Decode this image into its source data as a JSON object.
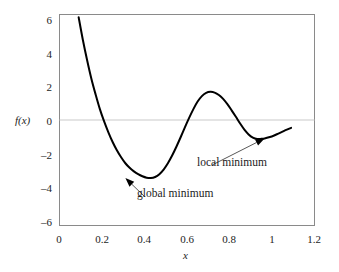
{
  "figure": {
    "background_color": "#ffffff",
    "frame_color": "#8a8a8a",
    "curve_color": "#000000",
    "zero_line_color": "#c9c9c9",
    "text_color": "#242424"
  },
  "chart_data": {
    "type": "line",
    "title": "",
    "subtitle": "",
    "xlabel": "x",
    "ylabel": "f(x)",
    "xlim": [
      0,
      1.2
    ],
    "ylim": [
      -6,
      6
    ],
    "grid": false,
    "zero_line": true,
    "legend": "none",
    "x_ticks": [
      0,
      0.2,
      0.4,
      0.6,
      0.8,
      1,
      1.2
    ],
    "x_tick_labels": [
      "0",
      "0.2",
      "0.4",
      "0.6",
      "0.8",
      "1",
      "1.2"
    ],
    "y_ticks": [
      6,
      4,
      2,
      0,
      -2,
      -4,
      -6
    ],
    "y_tick_labels": [
      "6",
      "4",
      "2",
      "0",
      "–2",
      "–4",
      "–6"
    ],
    "series": [
      {
        "name": "f(x)",
        "color": "#000000",
        "line_width": 2.0,
        "x": [
          0.09,
          0.11,
          0.13,
          0.15,
          0.17,
          0.19,
          0.21,
          0.23,
          0.25,
          0.27,
          0.29,
          0.31,
          0.33,
          0.35,
          0.37,
          0.39,
          0.41,
          0.43,
          0.45,
          0.47,
          0.49,
          0.51,
          0.53,
          0.55,
          0.57,
          0.59,
          0.61,
          0.63,
          0.65,
          0.67,
          0.69,
          0.71,
          0.73,
          0.75,
          0.77,
          0.79,
          0.81,
          0.83,
          0.85,
          0.87,
          0.89,
          0.91,
          0.93,
          0.95,
          0.965,
          0.99,
          1.01,
          1.03,
          1.05,
          1.07,
          1.09
        ],
        "y": [
          5.85,
          4.55,
          3.4,
          2.35,
          1.45,
          0.62,
          -0.08,
          -0.7,
          -1.25,
          -1.72,
          -2.12,
          -2.46,
          -2.72,
          -2.92,
          -3.08,
          -3.2,
          -3.28,
          -3.3,
          -3.24,
          -3.08,
          -2.82,
          -2.46,
          -2.02,
          -1.52,
          -0.98,
          -0.42,
          0.12,
          0.62,
          1.05,
          1.36,
          1.54,
          1.6,
          1.56,
          1.42,
          1.2,
          0.9,
          0.55,
          0.18,
          -0.2,
          -0.55,
          -0.82,
          -1.0,
          -1.08,
          -1.07,
          -1.05,
          -0.97,
          -0.88,
          -0.77,
          -0.66,
          -0.55,
          -0.45
        ]
      }
    ],
    "annotations": [
      {
        "id": "global-minimum",
        "label": "global minimum",
        "point_x": 0.31,
        "point_y": -3.3,
        "text_x": 0.4,
        "text_y": -4.35,
        "arrow": true
      },
      {
        "id": "local-minimum",
        "label": "local minimum",
        "point_x": 0.965,
        "point_y": -1.05,
        "text_x": 0.72,
        "text_y": -2.55,
        "arrow": true
      }
    ]
  }
}
